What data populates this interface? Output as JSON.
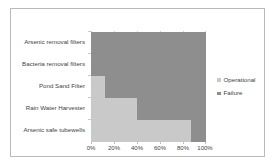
{
  "chart_data": {
    "type": "bar",
    "orientation": "horizontal",
    "stacked": true,
    "stack_mode": "percent",
    "title": "",
    "xlabel": "",
    "ylabel": "",
    "xlim": [
      0,
      100
    ],
    "grid": true,
    "legend_position": "right",
    "categories": [
      "Arsenic removal filters",
      "Bacteria removal filters",
      "Pond Sand Filter",
      "Rain Water Harvester",
      "Arsenic safe tubewells"
    ],
    "xticks": [
      0,
      20,
      40,
      60,
      80,
      100
    ],
    "xtick_labels": [
      "0%",
      "20%",
      "40%",
      "60%",
      "80%",
      "100%"
    ],
    "series": [
      {
        "name": "Operational",
        "color": "#c9c9c9",
        "values": [
          0,
          0,
          12,
          40,
          87
        ]
      },
      {
        "name": "Failure",
        "color": "#8e8e8e",
        "values": [
          100,
          100,
          88,
          60,
          13
        ]
      }
    ]
  },
  "legend": {
    "items": [
      {
        "label": "Operational",
        "color": "#c9c9c9"
      },
      {
        "label": "Failure",
        "color": "#8e8e8e"
      }
    ]
  }
}
